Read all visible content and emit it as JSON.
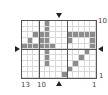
{
  "puzzle": {
    "columns": 13,
    "rows": 10,
    "filled_cells": [
      [
        0,
        4
      ],
      [
        1,
        3
      ],
      [
        1,
        4
      ],
      [
        2,
        2
      ],
      [
        2,
        4
      ],
      [
        3,
        2
      ],
      [
        3,
        3
      ],
      [
        3,
        4
      ],
      [
        4,
        0
      ],
      [
        4,
        1
      ],
      [
        4,
        2
      ],
      [
        4,
        3
      ],
      [
        4,
        4
      ],
      [
        4,
        5
      ],
      [
        4,
        6
      ],
      [
        4,
        7
      ],
      [
        5,
        4
      ],
      [
        8,
        2
      ],
      [
        9,
        2
      ],
      [
        10,
        2
      ],
      [
        11,
        2
      ],
      [
        12,
        2
      ],
      [
        8,
        3
      ],
      [
        12,
        3
      ],
      [
        12,
        4
      ],
      [
        11,
        5
      ],
      [
        10,
        6
      ],
      [
        9,
        7
      ],
      [
        8,
        8
      ],
      [
        7,
        9
      ]
    ],
    "thick_col_boundaries": [
      3,
      8
    ],
    "thick_row_boundaries": [
      5
    ],
    "bottom_labels": [
      {
        "text": "13",
        "col": 0
      },
      {
        "text": "10",
        "col": 3
      },
      {
        "text": "1",
        "col": 12
      }
    ],
    "right_labels": [
      {
        "text": "10",
        "row": 0
      },
      {
        "text": "1",
        "row": 9
      }
    ],
    "markers": {
      "top": "down-arrow",
      "bottom": "up-arrow",
      "left": "right-arrow",
      "right": "left-arrow"
    },
    "colors": {
      "filled": "#8c8c8c",
      "grid_line": "#d8d8d8",
      "thick_line": "#555555"
    }
  }
}
